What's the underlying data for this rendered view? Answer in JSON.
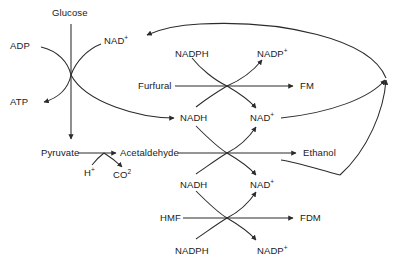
{
  "diagram": {
    "type": "metabolic-pathway",
    "background_color": "#ffffff",
    "line_color": "#2b2b2b",
    "text_color": "#1a1a1a",
    "nodes": [
      {
        "id": "glucose",
        "label": "Glucose",
        "sup": "",
        "x": 52,
        "y": 8
      },
      {
        "id": "adp",
        "label": "ADP",
        "sup": "",
        "x": 10,
        "y": 41
      },
      {
        "id": "nad-top",
        "label": "NAD",
        "sup": "+",
        "x": 104,
        "y": 36
      },
      {
        "id": "atp",
        "label": "ATP",
        "sup": "",
        "x": 10,
        "y": 97
      },
      {
        "id": "nadph-furfural",
        "label": "NADPH",
        "sup": "",
        "x": 175,
        "y": 49
      },
      {
        "id": "nadp-furfural",
        "label": "NADP",
        "sup": "+",
        "x": 257,
        "y": 49
      },
      {
        "id": "furfural",
        "label": "Furfural",
        "sup": "",
        "x": 138,
        "y": 81
      },
      {
        "id": "fm",
        "label": "FM",
        "sup": "",
        "x": 300,
        "y": 81
      },
      {
        "id": "nadh-furfural",
        "label": "NADH",
        "sup": "",
        "x": 180,
        "y": 113
      },
      {
        "id": "nad-furfural",
        "label": "NAD",
        "sup": "+",
        "x": 250,
        "y": 113
      },
      {
        "id": "pyruvate",
        "label": "Pyruvate",
        "sup": "",
        "x": 41,
        "y": 148
      },
      {
        "id": "acetaldehyde",
        "label": "Acetaldehyde",
        "sup": "",
        "x": 120,
        "y": 148
      },
      {
        "id": "proton",
        "label": "H",
        "sup": "+",
        "x": 84,
        "y": 168
      },
      {
        "id": "co2",
        "label": "CO",
        "sup": "2",
        "x": 113,
        "y": 170
      },
      {
        "id": "ethanol",
        "label": "Ethanol",
        "sup": "",
        "x": 303,
        "y": 148
      },
      {
        "id": "nadh-hmf",
        "label": "NADH",
        "sup": "",
        "x": 180,
        "y": 180
      },
      {
        "id": "nad-hmf",
        "label": "NAD",
        "sup": "+",
        "x": 250,
        "y": 180
      },
      {
        "id": "hmf",
        "label": "HMF",
        "sup": "",
        "x": 160,
        "y": 213
      },
      {
        "id": "fdm",
        "label": "FDM",
        "sup": "",
        "x": 300,
        "y": 213
      },
      {
        "id": "nadph-hmf",
        "label": "NADPH",
        "sup": "",
        "x": 175,
        "y": 246
      },
      {
        "id": "nadp-hmf",
        "label": "NADP",
        "sup": "+",
        "x": 257,
        "y": 246
      }
    ],
    "reactions": [
      {
        "id": "glycolysis",
        "substrate": "Glucose",
        "product": "Pyruvate",
        "cofactors_in": [
          "ADP",
          "NAD+"
        ],
        "cofactors_out": [
          "ATP",
          "NADH"
        ]
      },
      {
        "id": "furfural-reduction",
        "substrate": "Furfural",
        "product": "FM",
        "cofactors_in": [
          "NADPH",
          "NADH"
        ],
        "cofactors_out": [
          "NADP+",
          "NAD+"
        ]
      },
      {
        "id": "pyruvate-decarboxylation",
        "substrate": "Pyruvate",
        "product": "Acetaldehyde",
        "cofactors_in": [
          "H+"
        ],
        "cofactors_out": [
          "CO2"
        ]
      },
      {
        "id": "ethanol-formation",
        "substrate": "Acetaldehyde",
        "product": "Ethanol",
        "cofactors_in": [
          "NADH"
        ],
        "cofactors_out": [
          "NAD+"
        ]
      },
      {
        "id": "hmf-reduction",
        "substrate": "HMF",
        "product": "FDM",
        "cofactors_in": [
          "NADH",
          "NADPH"
        ],
        "cofactors_out": [
          "NAD+",
          "NADP+"
        ]
      }
    ],
    "recycle_note": "NAD+ pools from furfural and ethanol reactions converge at the right and return to the glycolysis NAD+ node"
  }
}
